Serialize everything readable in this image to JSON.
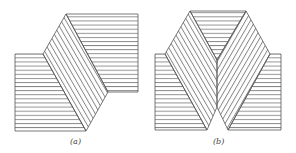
{
  "figures": [
    {
      "id": "a",
      "label": "(a)"
    },
    {
      "id": "b",
      "label": "(b)"
    }
  ],
  "colors": {
    "stroke": "#555555",
    "background": "#ffffff"
  }
}
